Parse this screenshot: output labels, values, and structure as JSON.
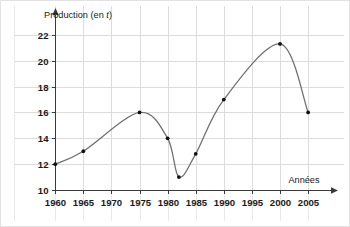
{
  "chart_data": {
    "type": "line",
    "title": "",
    "subtitle": "",
    "xlabel": "Années",
    "ylabel": "Production (en t)",
    "ylabel_parts": {
      "main": "Production (en ",
      "italic": "t",
      "tail": ")"
    },
    "x": [
      1960,
      1965,
      1975,
      1980,
      1982,
      1985,
      1990,
      2000,
      2005
    ],
    "values": [
      12,
      13,
      16,
      14,
      11,
      12.8,
      17,
      21.3,
      16
    ],
    "series": [
      {
        "name": "Production",
        "points": [
          {
            "x": 1960,
            "y": 12
          },
          {
            "x": 1965,
            "y": 13
          },
          {
            "x": 1975,
            "y": 16
          },
          {
            "x": 1980,
            "y": 14
          },
          {
            "x": 1982,
            "y": 11
          },
          {
            "x": 1985,
            "y": 12.8
          },
          {
            "x": 1990,
            "y": 17
          },
          {
            "x": 2000,
            "y": 21.3
          },
          {
            "x": 2005,
            "y": 16
          }
        ]
      }
    ],
    "xlim": [
      1958,
      2008
    ],
    "ylim": [
      10,
      23
    ],
    "xticks": [
      1960,
      1965,
      1970,
      1975,
      1980,
      1985,
      1990,
      1995,
      2000,
      2005
    ],
    "xtick_labels": [
      "1960",
      "1965",
      "1970",
      "1975",
      "1980",
      "1985",
      "1990",
      "1995",
      "2000",
      "2005"
    ],
    "yticks": [
      10,
      12,
      14,
      16,
      18,
      20,
      22
    ],
    "ytick_labels": [
      "10",
      "12",
      "14",
      "16",
      "18",
      "20",
      "22"
    ],
    "grid": true,
    "grid_axes": "both",
    "legend": false,
    "legend_position": "none",
    "markers": true,
    "smooth": true,
    "colors": {
      "line": "#6e6e6e",
      "marker": "#111111",
      "grid": "#dcdcdc",
      "axis": "#3a3a3a",
      "text": "#1a1a1a",
      "background": "#ffffff",
      "frame": "#e2e2e2"
    },
    "axis_arrows": {
      "x": true,
      "y": true
    }
  }
}
